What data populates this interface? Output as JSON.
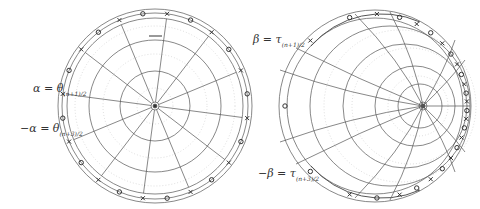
{
  "figure": {
    "left_panel": {
      "type": "polar disk",
      "labels": {
        "alpha": "α = θ",
        "alpha_sub": "(n+1)/2",
        "neg_alpha": "−α = θ",
        "neg_alpha_sub": "(n+3)/2"
      },
      "markers_per_side": 12
    },
    "right_panel": {
      "type": "hyperbolic (Möbius-shifted) disk",
      "labels": {
        "beta": "β = τ",
        "beta_sub": "(n+1)/2",
        "neg_beta": "−β = τ",
        "neg_beta_sub": "(n+3)/2"
      }
    },
    "colors": {
      "grid": "#555555",
      "grid_dotted": "#bbbbbb",
      "marker": "#333333",
      "text": "#333333"
    }
  }
}
